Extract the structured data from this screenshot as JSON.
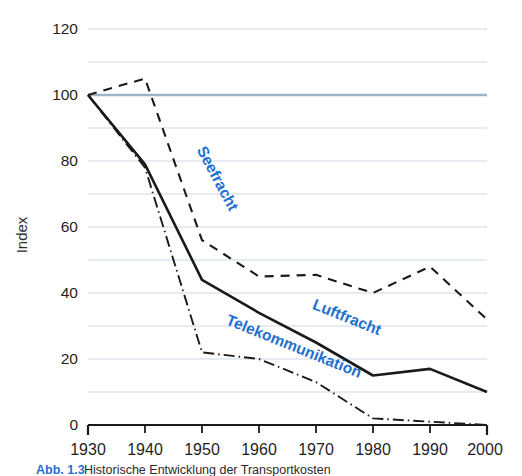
{
  "chart_data": {
    "type": "line",
    "title": "",
    "xlabel": "",
    "ylabel": "Index",
    "x": [
      1930,
      1940,
      1950,
      1960,
      1970,
      1980,
      1990,
      2000
    ],
    "xlim": [
      1930,
      2000
    ],
    "ylim": [
      0,
      120
    ],
    "yticks": [
      0,
      20,
      40,
      60,
      80,
      100,
      120
    ],
    "ytick_labels": [
      "0",
      "20",
      "40",
      "60",
      "80",
      "100",
      "120"
    ],
    "xtick_labels": [
      "1930",
      "1940",
      "1950",
      "1960",
      "1970",
      "1980",
      "1990",
      "2000"
    ],
    "grid": true,
    "grid_step": 10,
    "reference_line": 100,
    "legend_position": "inline-annotations",
    "series": [
      {
        "name": "Seefracht",
        "style": "dashed",
        "color": "#1a1a1a",
        "label_color": "#1f6fd0",
        "values": [
          100,
          105,
          56,
          45,
          45.5,
          40,
          48,
          32
        ]
      },
      {
        "name": "Luftfracht",
        "style": "solid",
        "color": "#1a1a1a",
        "label_color": "#1f6fd0",
        "values": [
          100,
          79,
          44,
          34,
          25,
          15,
          17,
          10
        ]
      },
      {
        "name": "Telekommunikation",
        "style": "dash-dot",
        "color": "#1a1a1a",
        "label_color": "#1f6fd0",
        "values": [
          100,
          78,
          22,
          20,
          13,
          2,
          1,
          0
        ]
      }
    ],
    "annotations": [
      {
        "text": "Seefracht",
        "x": 1944,
        "y": 80,
        "rotation": 62,
        "color": "#1f6fd0"
      },
      {
        "text": "Luftfracht",
        "x": 1969,
        "y": 32,
        "rotation": 22,
        "color": "#1f6fd0"
      },
      {
        "text": "Telekommunikation",
        "x": 1958,
        "y": 21,
        "rotation": 22,
        "color": "#1f6fd0"
      }
    ],
    "colors": {
      "gridline": "#dce5ed",
      "reference_gridline": "#9fb3c2",
      "axis": "#1a1a1a",
      "accent_blue": "#1f6fd0",
      "text": "#1f1f1f"
    }
  },
  "caption": {
    "label": "Abb. 1.3",
    "text": "Historische Entwicklung der Transportkosten"
  }
}
